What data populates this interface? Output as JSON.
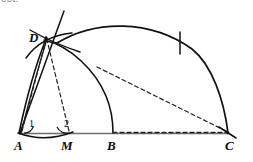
{
  "figure": {
    "cut_text_above": "eet.",
    "background_color": "#ffffff",
    "ink_color": "#111111",
    "dash_color": "#222222",
    "baseline_color": "#6e6e6e",
    "width": 253,
    "height": 162
  },
  "points": [
    {
      "id": "A",
      "label": "A",
      "x": 20,
      "y": 133,
      "label_x": 14,
      "label_y": 140
    },
    {
      "id": "M",
      "label": "M",
      "x": 69,
      "y": 133,
      "label_x": 61,
      "label_y": 140
    },
    {
      "id": "B",
      "label": "B",
      "x": 113,
      "y": 133,
      "label_x": 107,
      "label_y": 140
    },
    {
      "id": "C",
      "label": "C",
      "x": 228,
      "y": 133,
      "label_x": 226,
      "label_y": 140
    },
    {
      "id": "D",
      "label": "D",
      "x": 46,
      "y": 38,
      "label_x": 29,
      "label_y": 32
    }
  ],
  "angles": [
    {
      "id": "1",
      "label": "1",
      "at": "A",
      "label_x": 29,
      "label_y": 119
    },
    {
      "id": "2",
      "label": "2",
      "at": "M",
      "label_x": 64,
      "label_y": 119
    }
  ],
  "segments": [
    {
      "id": "baseline-A-C",
      "from": "A",
      "to": "C",
      "style": "solid"
    },
    {
      "id": "A-D-solid",
      "from": "A",
      "to": "D",
      "style": "solid"
    },
    {
      "id": "A-D-dashed",
      "from": "A",
      "to": "D",
      "style": "dashed"
    },
    {
      "id": "M-D-dashed",
      "from": "M",
      "to": "D",
      "style": "dashed"
    },
    {
      "id": "ray-through-D",
      "from": "A",
      "to": "top-right",
      "style": "solid"
    },
    {
      "id": "E-C-dashed",
      "from": "arc-intersection",
      "to": "C",
      "style": "dashed"
    },
    {
      "id": "B-C-dashed",
      "from": "B",
      "to": "C",
      "style": "dashed"
    }
  ],
  "arcs": [
    {
      "id": "large-arc-D-to-C",
      "style": "solid",
      "note": "large arc from D region over to C"
    },
    {
      "id": "arc-A-to-B",
      "style": "solid",
      "note": "arc centered at A through B"
    },
    {
      "id": "arc-D-small",
      "style": "solid",
      "note": "small construction arc near D"
    },
    {
      "id": "arc-below-AM",
      "style": "solid",
      "note": "construction arc below segment A-M"
    }
  ],
  "tick_marks": [
    {
      "id": "tick-on-large-arc",
      "x": 180,
      "y": 43
    },
    {
      "id": "tick-at-C",
      "x": 228,
      "y": 133
    }
  ]
}
